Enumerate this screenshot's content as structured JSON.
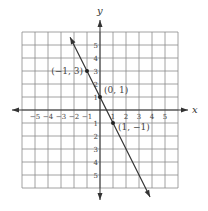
{
  "graph": {
    "x_axis_label": "x",
    "y_axis_label": "y",
    "x_range": [
      -6,
      6
    ],
    "y_range": [
      -6,
      6
    ],
    "x_ticks": [
      {
        "value": -5,
        "label": "−5"
      },
      {
        "value": -4,
        "label": "−4"
      },
      {
        "value": -3,
        "label": "−3"
      },
      {
        "value": -2,
        "label": "−2"
      },
      {
        "value": -1,
        "label": "−1"
      },
      {
        "value": 1,
        "label": "1"
      },
      {
        "value": 2,
        "label": "2"
      },
      {
        "value": 3,
        "label": "3"
      },
      {
        "value": 4,
        "label": "4"
      },
      {
        "value": 5,
        "label": "5"
      }
    ],
    "y_ticks": [
      {
        "value": 5,
        "label": "5"
      },
      {
        "value": 4,
        "label": "4"
      },
      {
        "value": 3,
        "label": "3"
      },
      {
        "value": 2,
        "label": "2"
      },
      {
        "value": 1,
        "label": "1"
      },
      {
        "value": -1,
        "label": "1"
      },
      {
        "value": -2,
        "label": "2"
      },
      {
        "value": -3,
        "label": "3"
      },
      {
        "value": -4,
        "label": "4"
      },
      {
        "value": -5,
        "label": "5"
      }
    ],
    "line": {
      "slope": -2,
      "intercept": 1,
      "color": "#333333"
    },
    "points": [
      {
        "x": -1,
        "y": 3,
        "label": "(−1, 3)"
      },
      {
        "x": 0,
        "y": 1,
        "label": "(0, 1)"
      },
      {
        "x": 1,
        "y": -1,
        "label": "(1, −1)"
      }
    ]
  }
}
